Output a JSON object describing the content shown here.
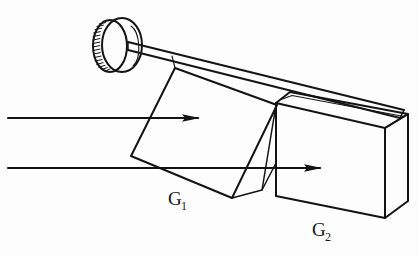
{
  "figure": {
    "kind": "line-drawing",
    "background_color": "#fdfdfd",
    "ink_color": "#141414",
    "width": 418,
    "height": 256
  },
  "labels": {
    "wedge": {
      "base": "G",
      "subscript": "1",
      "full": "G1",
      "x": 168,
      "y": 205
    },
    "slab": {
      "base": "G",
      "subscript": "2",
      "full": "G2",
      "x": 312,
      "y": 236
    }
  },
  "components": {
    "knob": {
      "name": "knurled-thumbwheel",
      "center_x": 120,
      "center_y": 45,
      "radius_x": 20,
      "radius_y": 27,
      "knurl_teeth": 18
    },
    "rod": {
      "name": "actuator-rod",
      "from_x": 128,
      "from_y": 45,
      "to_x": 404,
      "to_y": 132
    },
    "wedge_prism": {
      "name": "G1",
      "description": "tilted wedge prism, left element"
    },
    "slab_block": {
      "name": "G2",
      "description": "rectangular glass slab, right element"
    }
  },
  "rays": [
    {
      "name": "upper-ray",
      "start_x": 8,
      "start_y": 118,
      "end_x": 200,
      "end_y": 118,
      "arrowhead": true
    },
    {
      "name": "lower-ray",
      "start_x": 8,
      "start_y": 168,
      "end_x": 322,
      "end_y": 168,
      "arrowhead": true
    }
  ],
  "caption": {
    "ghost_text": ""
  }
}
